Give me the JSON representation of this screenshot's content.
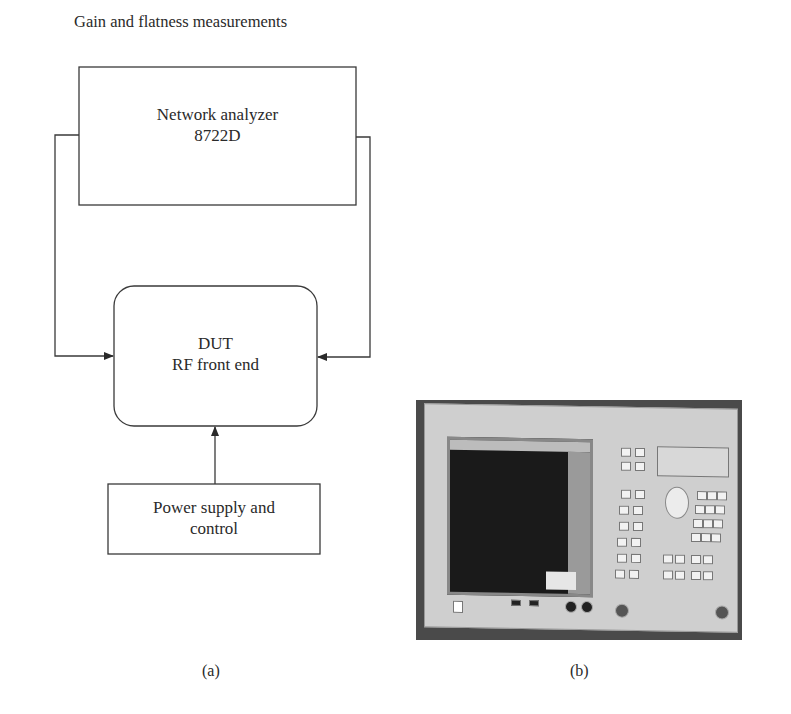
{
  "figure": {
    "title": "Gain and flatness measurements",
    "panel_a": {
      "label": "(a)",
      "blocks": {
        "network_analyzer": {
          "line1": "Network analyzer",
          "line2": "8722D"
        },
        "dut": {
          "line1": "DUT",
          "line2": "RF front end"
        },
        "power_supply": {
          "line1": "Power supply and",
          "line2": "control"
        }
      },
      "connections": [
        {
          "from": "Network analyzer 8722D (left side)",
          "to": "DUT RF front end (left side)"
        },
        {
          "from": "Network analyzer 8722D (right side)",
          "to": "DUT RF front end (right side)"
        },
        {
          "from": "Power supply and control",
          "to": "DUT RF front end (bottom)"
        }
      ]
    },
    "panel_b": {
      "label": "(b)",
      "image_description": "Photograph of network analyzer instrument front panel"
    },
    "colors": {
      "line": "#3a3a3a",
      "text": "#2a2a2a",
      "background": "#ffffff"
    }
  }
}
